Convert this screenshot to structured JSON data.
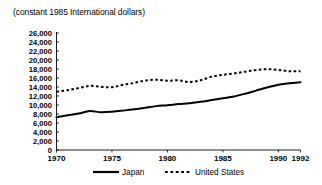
{
  "chart_data": {
    "type": "line",
    "title": "(constant 1985 International dollars)",
    "xlabel": "",
    "ylabel": "",
    "xlim": [
      1970,
      1992
    ],
    "ylim": [
      0,
      26000
    ],
    "ytick_step": 2000,
    "grid": false,
    "legend_position": "bottom",
    "x": [
      1970,
      1971,
      1972,
      1973,
      1974,
      1975,
      1976,
      1977,
      1978,
      1979,
      1980,
      1981,
      1982,
      1983,
      1984,
      1985,
      1986,
      1987,
      1988,
      1989,
      1990,
      1991,
      1992
    ],
    "xticks": [
      1970,
      1975,
      1980,
      1985,
      1990,
      1992
    ],
    "xtick_labels": [
      "1970",
      "1975",
      "1980",
      "1985",
      "1990",
      "1992"
    ],
    "yticks": [
      0,
      2000,
      4000,
      6000,
      8000,
      10000,
      12000,
      14000,
      16000,
      18000,
      20000,
      22000,
      24000,
      26000
    ],
    "ytick_labels": [
      "0",
      "2,000",
      "4,000",
      "6,000",
      "8,000",
      "10,000",
      "12,000",
      "14,000",
      "16,000",
      "18,000",
      "20,000",
      "22,000",
      "24,000",
      "26,000"
    ],
    "series": [
      {
        "name": "Japan",
        "style": "solid",
        "color": "#000000",
        "values": [
          7300,
          7700,
          8100,
          8650,
          8400,
          8500,
          8750,
          9050,
          9400,
          9750,
          9950,
          10200,
          10400,
          10700,
          11100,
          11500,
          11900,
          12500,
          13200,
          13900,
          14500,
          14850,
          15050
        ]
      },
      {
        "name": "United States",
        "style": "dashed",
        "color": "#000000",
        "values": [
          12950,
          13300,
          13750,
          14250,
          14050,
          13950,
          14500,
          14900,
          15450,
          15600,
          15400,
          15500,
          15100,
          15500,
          16300,
          16700,
          17000,
          17400,
          17800,
          17950,
          17800,
          17500,
          17500
        ]
      }
    ]
  },
  "legend": {
    "entries": [
      {
        "label": "Japan",
        "style": "solid"
      },
      {
        "label": "United States",
        "style": "dashed"
      }
    ]
  }
}
